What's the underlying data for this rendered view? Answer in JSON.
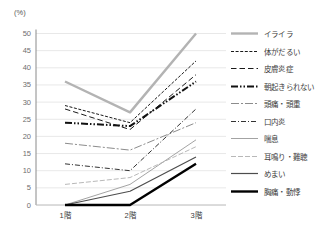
{
  "chart": {
    "unit_label": "(%)"
  },
  "chart_data": {
    "type": "line",
    "title": "",
    "xlabel": "",
    "ylabel": "(%)",
    "categories": [
      "1階",
      "2階",
      "3階"
    ],
    "ylim": [
      0,
      50
    ],
    "yticks": [
      0,
      5,
      10,
      15,
      20,
      25,
      30,
      35,
      40,
      45,
      50
    ],
    "grid": true,
    "legend_position": "right",
    "series": [
      {
        "name": "イライラ",
        "values": [
          36,
          27,
          50
        ],
        "color": "#b3b3b3",
        "width": 2.4,
        "dash": ""
      },
      {
        "name": "体がだるい",
        "values": [
          29,
          24,
          42
        ],
        "color": "#1a1a1a",
        "width": 1,
        "dash": "3 1.6"
      },
      {
        "name": "皮膚炎症",
        "values": [
          28,
          22,
          38
        ],
        "color": "#1a1a1a",
        "width": 1,
        "dash": "5.5 3"
      },
      {
        "name": "朝起きられない",
        "values": [
          24,
          23,
          36
        ],
        "color": "#111111",
        "width": 2,
        "dash": "7 2 1.5 2 1.5 2"
      },
      {
        "name": "頭痛・頭重",
        "values": [
          18,
          16,
          24
        ],
        "color": "#8c8c8c",
        "width": 1,
        "dash": "8 2 2 2"
      },
      {
        "name": "口内炎",
        "values": [
          12,
          10,
          28
        ],
        "color": "#333333",
        "width": 1,
        "dash": "5 2 1 2"
      },
      {
        "name": "喘息",
        "values": [
          0,
          6,
          19
        ],
        "color": "#999999",
        "width": 0.9,
        "dash": ""
      },
      {
        "name": "耳鳴り・難聴",
        "values": [
          6,
          8,
          17
        ],
        "color": "#b0b0b0",
        "width": 0.9,
        "dash": "5 2"
      },
      {
        "name": "めまい",
        "values": [
          0,
          4,
          14
        ],
        "color": "#4d4d4d",
        "width": 1.2,
        "dash": ""
      },
      {
        "name": "胸痛・動悸",
        "values": [
          0,
          0,
          12
        ],
        "color": "#000000",
        "width": 2.4,
        "dash": ""
      }
    ]
  }
}
